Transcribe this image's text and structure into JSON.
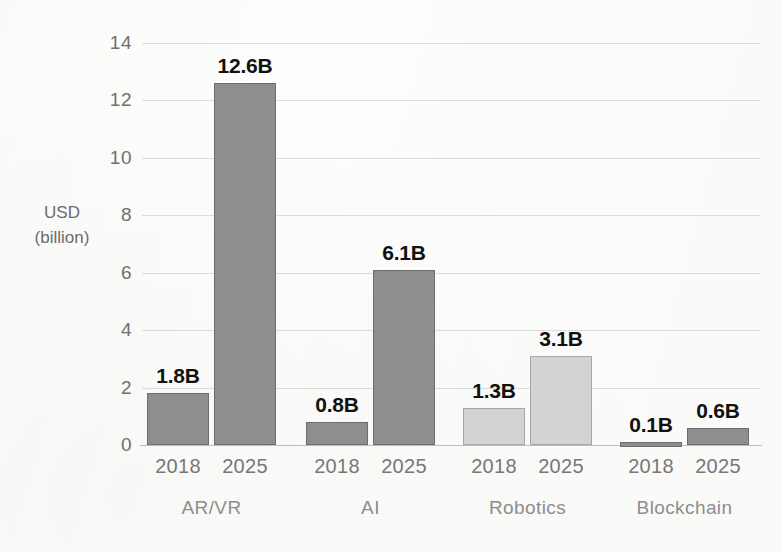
{
  "chart_data": {
    "type": "bar",
    "title": "",
    "subtitle": "",
    "xlabel": "",
    "ylabel": "USD (billion)",
    "ylabel_lines": [
      "USD",
      "(billion)"
    ],
    "ylim": [
      0,
      14
    ],
    "ytick_values": [
      0,
      2,
      4,
      6,
      8,
      10,
      12,
      14
    ],
    "ytick_labels": [
      "0",
      "2",
      "4",
      "6",
      "8",
      "10",
      "12",
      "14"
    ],
    "grid": true,
    "legend": "none",
    "categories": [
      "AR/VR",
      "AI",
      "Robotics",
      "Blockchain"
    ],
    "series": [
      {
        "name": "2018",
        "values": [
          1.8,
          0.8,
          1.3,
          0.1
        ]
      },
      {
        "name": "2025",
        "values": [
          12.6,
          6.1,
          3.1,
          0.6
        ]
      }
    ],
    "bars": [
      {
        "category": "AR/VR",
        "year": "2018",
        "value": 1.8,
        "label": "1.8B",
        "shade": "dark"
      },
      {
        "category": "AR/VR",
        "year": "2025",
        "value": 12.6,
        "label": "12.6B",
        "shade": "dark"
      },
      {
        "category": "AI",
        "year": "2018",
        "value": 0.8,
        "label": "0.8B",
        "shade": "dark"
      },
      {
        "category": "AI",
        "year": "2025",
        "value": 6.1,
        "label": "6.1B",
        "shade": "dark"
      },
      {
        "category": "Robotics",
        "year": "2018",
        "value": 1.3,
        "label": "1.3B",
        "shade": "light"
      },
      {
        "category": "Robotics",
        "year": "2025",
        "value": 3.1,
        "label": "3.1B",
        "shade": "light"
      },
      {
        "category": "Blockchain",
        "year": "2018",
        "value": 0.1,
        "label": "0.1B",
        "shade": "dark"
      },
      {
        "category": "Blockchain",
        "year": "2025",
        "value": 0.6,
        "label": "0.6B",
        "shade": "dark"
      }
    ],
    "colors": {
      "bar_dark": "#8e8e8e",
      "bar_dark_edge": "#6d6d6d",
      "bar_light": "#d3d3d3",
      "bar_light_edge": "#a6a6a6",
      "gridline": "#dcdcdc",
      "axis": "#bdbdbd",
      "value_label": "#111111",
      "tick_label": "#6f6f6f",
      "category_label": "#8d8d8d",
      "background": "#fdfdfc"
    }
  }
}
